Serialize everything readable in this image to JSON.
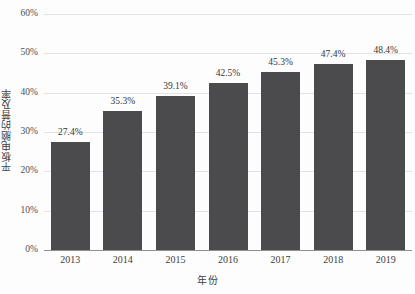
{
  "chart_data": {
    "type": "bar",
    "title": "",
    "xlabel": "年份",
    "ylabel": "平板电脑的普及率",
    "categories": [
      "2013",
      "2014",
      "2015",
      "2016",
      "2017",
      "2018",
      "2019"
    ],
    "values": [
      27.4,
      35.3,
      39.1,
      42.5,
      45.3,
      47.4,
      48.4
    ],
    "data_labels": [
      "27.4%",
      "35.3%",
      "39.1%",
      "42.5%",
      "45.3%",
      "47.4%",
      "48.4%"
    ],
    "ylim": [
      0,
      60
    ],
    "y_ticks": [
      0,
      10,
      20,
      30,
      40,
      50,
      60
    ],
    "y_tick_labels": [
      "0%",
      "10%",
      "20%",
      "30%",
      "40%",
      "50%",
      "60%"
    ],
    "grid": true,
    "legend": null,
    "bar_color": "#4b4b4e",
    "gridline_color": "#e3e3e6",
    "axis_color": "#8f8f93",
    "background_color": "#fdfdfd"
  }
}
